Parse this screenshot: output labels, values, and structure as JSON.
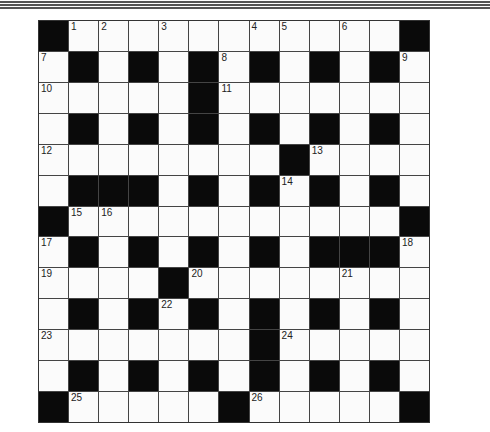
{
  "puzzle": {
    "rows": 13,
    "cols": 13,
    "colors": {
      "black": "#0a0a0a",
      "white": "#fbfbfb",
      "line": "#444444"
    },
    "grid": [
      "#...........#",
      ".#.#.#.#.#.#.",
      ".....#.......",
      ".#.#.#.#.#.#.",
      "........#....",
      ".###.#.#.#.#.",
      "#...........#",
      ".#.#.#.#.###.",
      "....#........",
      ".#.#.#.#.#.#.",
      ".......#.....",
      ".#.#.#.#.#.#.",
      "#.....#.....#"
    ],
    "numbers": [
      {
        "r": 0,
        "c": 1,
        "n": "1"
      },
      {
        "r": 0,
        "c": 2,
        "n": "2"
      },
      {
        "r": 0,
        "c": 4,
        "n": "3"
      },
      {
        "r": 0,
        "c": 7,
        "n": "4"
      },
      {
        "r": 0,
        "c": 8,
        "n": "5"
      },
      {
        "r": 0,
        "c": 10,
        "n": "6"
      },
      {
        "r": 1,
        "c": 0,
        "n": "7"
      },
      {
        "r": 1,
        "c": 6,
        "n": "8"
      },
      {
        "r": 1,
        "c": 12,
        "n": "9"
      },
      {
        "r": 2,
        "c": 0,
        "n": "10"
      },
      {
        "r": 2,
        "c": 6,
        "n": "11"
      },
      {
        "r": 4,
        "c": 0,
        "n": "12"
      },
      {
        "r": 4,
        "c": 9,
        "n": "13"
      },
      {
        "r": 5,
        "c": 8,
        "n": "14"
      },
      {
        "r": 6,
        "c": 1,
        "n": "15"
      },
      {
        "r": 6,
        "c": 2,
        "n": "16"
      },
      {
        "r": 7,
        "c": 0,
        "n": "17"
      },
      {
        "r": 7,
        "c": 12,
        "n": "18"
      },
      {
        "r": 8,
        "c": 0,
        "n": "19"
      },
      {
        "r": 8,
        "c": 5,
        "n": "20"
      },
      {
        "r": 8,
        "c": 10,
        "n": "21"
      },
      {
        "r": 9,
        "c": 4,
        "n": "22"
      },
      {
        "r": 10,
        "c": 0,
        "n": "23"
      },
      {
        "r": 10,
        "c": 8,
        "n": "24"
      },
      {
        "r": 12,
        "c": 1,
        "n": "25"
      },
      {
        "r": 12,
        "c": 7,
        "n": "26"
      }
    ]
  }
}
